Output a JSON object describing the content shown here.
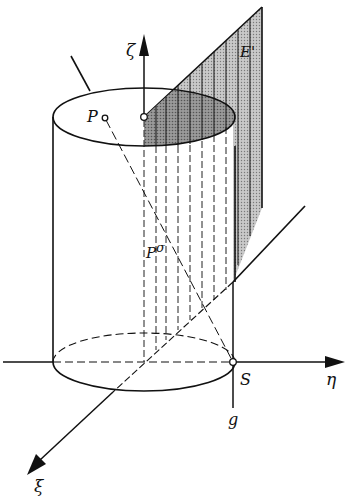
{
  "figure": {
    "labels": {
      "zeta_axis": "ζ",
      "eta_axis": "η",
      "xi_axis": "ξ",
      "plane": "E'",
      "point_p": "P",
      "point_p_proj": "P",
      "point_p_proj_sup": "σ",
      "point_s": "S",
      "line_g": "g"
    },
    "colors": {
      "ink": "#111111",
      "shade_plane": "#b8b8b8",
      "shade_section": "#8e8e8e",
      "background": "#ffffff"
    }
  }
}
